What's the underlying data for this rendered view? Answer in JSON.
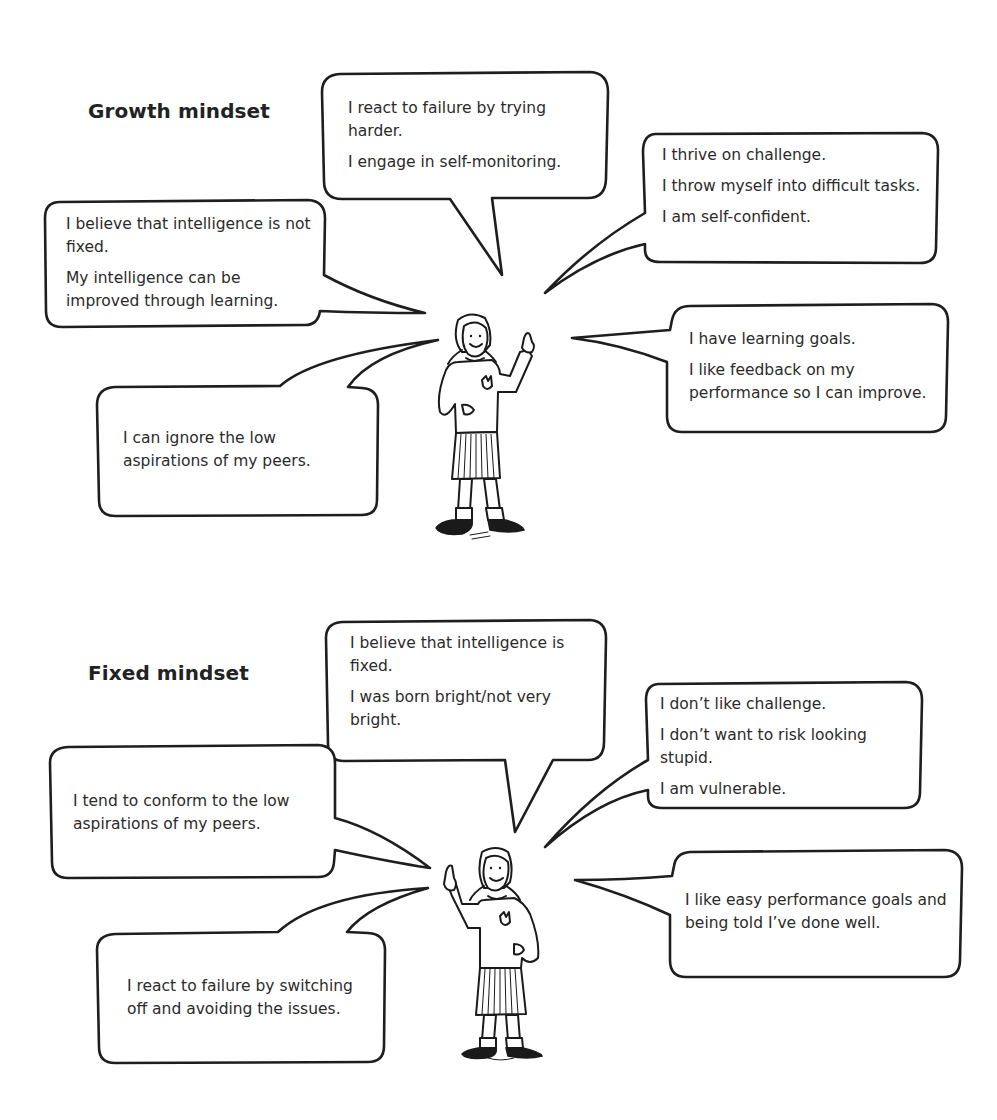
{
  "growth": {
    "title": "Growth mindset",
    "bubbles": {
      "top": {
        "lines": [
          "I react to failure by trying harder.",
          "I engage in self-monitoring."
        ]
      },
      "top_right": {
        "lines": [
          "I thrive on challenge.",
          "I throw myself into difficult tasks.",
          "I am self-confident."
        ]
      },
      "left": {
        "lines": [
          "I believe that intelligence is not fixed.",
          "My intelligence can be improved through learning."
        ]
      },
      "right": {
        "lines": [
          "I have learning goals.",
          "I like feedback on my performance so I can improve."
        ]
      },
      "bottom_left": {
        "lines": [
          "I can ignore the low aspirations of my peers."
        ]
      }
    },
    "figure": {
      "icon": "schoolgirl-pointing-up-right-icon"
    }
  },
  "fixed": {
    "title": "Fixed mindset",
    "bubbles": {
      "top": {
        "lines": [
          "I believe that intelligence is fixed.",
          "I was born bright/not very bright."
        ]
      },
      "top_right": {
        "lines": [
          "I don’t like challenge.",
          "I don’t want to risk looking stupid.",
          "I am vulnerable."
        ]
      },
      "left": {
        "lines": [
          "I tend to conform to the low aspirations of my peers."
        ]
      },
      "right": {
        "lines": [
          "I like easy performance goals and being told I’ve done well."
        ]
      },
      "bottom_left": {
        "lines": [
          "I react to failure by switching off and avoiding the issues."
        ]
      }
    },
    "figure": {
      "icon": "schoolgirl-pointing-up-left-icon"
    }
  },
  "colors": {
    "ink": "#1e1e1e",
    "text": "#2b2b2b",
    "background": "#ffffff"
  }
}
